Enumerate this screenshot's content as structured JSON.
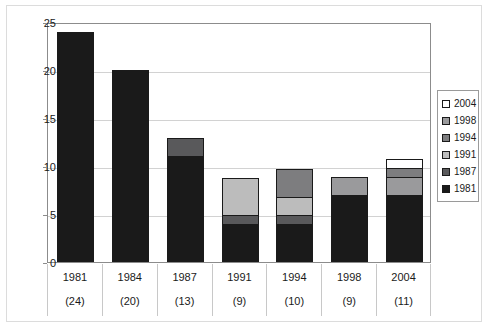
{
  "chart_data": {
    "type": "bar",
    "stacked": true,
    "title": "",
    "xlabel": "",
    "ylabel": "",
    "ylim": [
      0,
      25
    ],
    "yticks": [
      0,
      5,
      10,
      15,
      20,
      25
    ],
    "grid": true,
    "legend_position": "right",
    "categories": [
      "1981",
      "1984",
      "1987",
      "1991",
      "1994",
      "1998",
      "2004"
    ],
    "category_counts": [
      "(24)",
      "(20)",
      "(13)",
      "(9)",
      "(10)",
      "(9)",
      "(11)"
    ],
    "totals": [
      24,
      20,
      13,
      9,
      10,
      9,
      11
    ],
    "series": [
      {
        "name": "1981",
        "color": "#1a1a1a",
        "values": [
          24,
          20,
          11,
          4,
          4,
          7,
          7
        ]
      },
      {
        "name": "1987",
        "color": "#59595b",
        "values": [
          0,
          0,
          2,
          1,
          1,
          0,
          0
        ]
      },
      {
        "name": "1991",
        "color": "#bcbcbc",
        "values": [
          0,
          0,
          0,
          4,
          2,
          0,
          0
        ]
      },
      {
        "name": "1994",
        "color": "#7d7d7f",
        "values": [
          0,
          0,
          0,
          0,
          3,
          0,
          0
        ]
      },
      {
        "name": "1998",
        "color": "#9a9a9c",
        "values": [
          0,
          0,
          0,
          0,
          0,
          2,
          2
        ]
      },
      {
        "name": "2004",
        "color": "#ffffff",
        "values": [
          0,
          0,
          0,
          0,
          0,
          0,
          2
        ]
      }
    ],
    "legend_entries": [
      {
        "label": "2004",
        "color": "#ffffff"
      },
      {
        "label": "1998",
        "color": "#9a9a9c"
      },
      {
        "label": "1994",
        "color": "#7d7d7f"
      },
      {
        "label": "1991",
        "color": "#bcbcbc"
      },
      {
        "label": "1987",
        "color": "#59595b"
      },
      {
        "label": "1981",
        "color": "#1a1a1a"
      }
    ],
    "bar_stacks": [
      {
        "category": "1981",
        "segments": [
          {
            "series": "1981",
            "value": 24
          }
        ]
      },
      {
        "category": "1984",
        "segments": [
          {
            "series": "1981",
            "value": 20
          }
        ]
      },
      {
        "category": "1987",
        "segments": [
          {
            "series": "1981",
            "value": 11
          },
          {
            "series": "1987",
            "value": 2
          }
        ]
      },
      {
        "category": "1991",
        "segments": [
          {
            "series": "1981",
            "value": 4
          },
          {
            "series": "1987",
            "value": 1
          },
          {
            "series": "1991",
            "value": 4
          }
        ]
      },
      {
        "category": "1994",
        "segments": [
          {
            "series": "1981",
            "value": 4
          },
          {
            "series": "1987",
            "value": 1
          },
          {
            "series": "1991",
            "value": 2
          },
          {
            "series": "1994",
            "value": 3
          }
        ]
      },
      {
        "category": "1998",
        "segments": [
          {
            "series": "1981",
            "value": 7
          },
          {
            "series": "1998",
            "value": 2
          }
        ]
      },
      {
        "category": "2004",
        "segments": [
          {
            "series": "1981",
            "value": 7
          },
          {
            "series": "1998",
            "value": 2
          },
          {
            "series": "1994",
            "value": 1
          },
          {
            "series": "2004",
            "value": 1
          }
        ]
      }
    ]
  }
}
